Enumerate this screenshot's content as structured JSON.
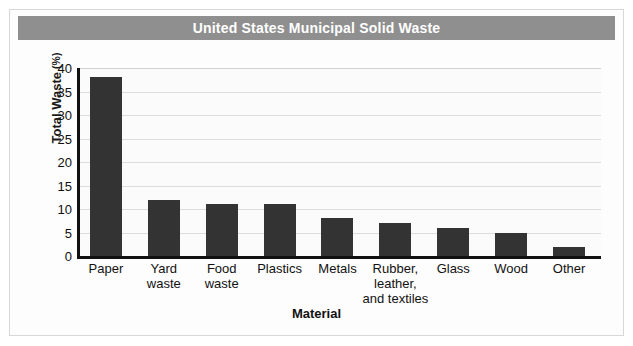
{
  "chart_data": {
    "type": "bar",
    "title": "United States Municipal Solid Waste",
    "xlabel": "Material",
    "ylabel": "Total Waste",
    "ylabel_unit": "(%)",
    "categories": [
      "Paper",
      "Yard waste",
      "Food waste",
      "Plastics",
      "Metals",
      "Rubber, leather, and textiles",
      "Glass",
      "Wood",
      "Other"
    ],
    "category_lines": [
      [
        "Paper"
      ],
      [
        "Yard",
        "waste"
      ],
      [
        "Food",
        "waste"
      ],
      [
        "Plastics"
      ],
      [
        "Metals"
      ],
      [
        "Rubber,",
        "leather,",
        "and textiles"
      ],
      [
        "Glass"
      ],
      [
        "Wood"
      ],
      [
        "Other"
      ]
    ],
    "values": [
      38,
      12,
      11,
      11,
      8,
      7,
      6,
      5,
      2
    ],
    "ylim": [
      0,
      40
    ],
    "yticks": [
      0,
      5,
      10,
      15,
      20,
      25,
      30,
      35,
      40
    ],
    "ytick_labels": [
      "0",
      "5",
      "10",
      "15",
      "20",
      "25",
      "30",
      "35",
      "40"
    ],
    "grid": true,
    "legend": "none",
    "bar_color": "#333333",
    "title_band_color": "#8f8f8f",
    "title_text_color": "#ffffff",
    "gridline_color": "#dcdcdc",
    "axis_color": "#111111",
    "plot_background": "#fbfbfb"
  }
}
